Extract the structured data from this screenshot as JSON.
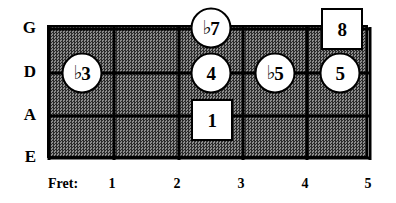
{
  "diagram": {
    "type": "guitar-fretboard-chart",
    "title": "",
    "strings": [
      {
        "name": "G",
        "y": 27
      },
      {
        "name": "D",
        "y": 71
      },
      {
        "name": "A",
        "y": 114
      },
      {
        "name": "E",
        "y": 156
      }
    ],
    "fret_axis": {
      "title": "Fret:",
      "title_x": 48,
      "y": 184,
      "labels": [
        {
          "text": "1",
          "x": 112
        },
        {
          "text": "2",
          "x": 177
        },
        {
          "text": "3",
          "x": 241
        },
        {
          "text": "4",
          "x": 305
        },
        {
          "text": "5",
          "x": 368
        }
      ]
    },
    "board": {
      "left": 47,
      "top": 25,
      "width": 321,
      "height": 133,
      "fill_color": "#4a4a4a",
      "line_color": "#000000"
    },
    "string_lines_y": [
      27,
      71,
      114,
      156
    ],
    "fret_lines_x": [
      47,
      112,
      177,
      241,
      305,
      368
    ],
    "markers": [
      {
        "label": "3",
        "flat": true,
        "shape": "circle",
        "x": 82,
        "y": 73,
        "string": "D",
        "fret": 1,
        "name": "marker-flat3"
      },
      {
        "label": "7",
        "flat": true,
        "shape": "circle",
        "x": 211,
        "y": 28,
        "string": "G",
        "fret": 3,
        "name": "marker-flat7"
      },
      {
        "label": "4",
        "flat": false,
        "shape": "circle",
        "x": 211,
        "y": 73,
        "string": "D",
        "fret": 3,
        "name": "marker-4"
      },
      {
        "label": "1",
        "flat": false,
        "shape": "square",
        "x": 212,
        "y": 120,
        "string": "A",
        "fret": 3,
        "name": "marker-1-root"
      },
      {
        "label": "5",
        "flat": true,
        "shape": "circle",
        "x": 275,
        "y": 73,
        "string": "D",
        "fret": 4,
        "name": "marker-flat5"
      },
      {
        "label": "5",
        "flat": false,
        "shape": "circle",
        "x": 340,
        "y": 73,
        "string": "D",
        "fret": 5,
        "name": "marker-5"
      },
      {
        "label": "8",
        "flat": false,
        "shape": "square",
        "x": 342,
        "y": 29,
        "string": "G",
        "fret": 5,
        "name": "marker-8-octave"
      }
    ]
  }
}
